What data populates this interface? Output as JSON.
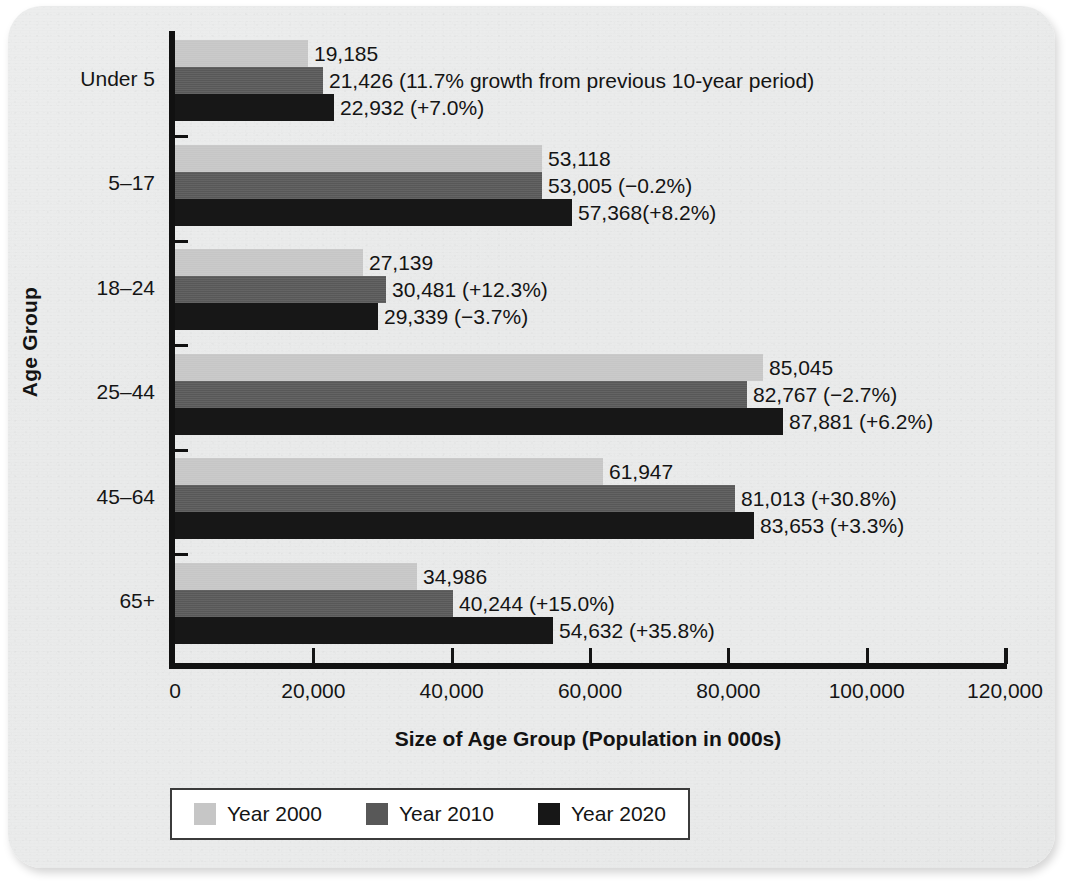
{
  "chart_data": {
    "type": "bar",
    "orientation": "horizontal",
    "title": "",
    "xlabel": "Size of Age Group (Population in 000s)",
    "ylabel": "Age Group",
    "xlim": [
      0,
      120000
    ],
    "xticks": [
      0,
      20000,
      40000,
      60000,
      80000,
      100000,
      120000
    ],
    "xtick_labels": [
      "0",
      "20,000",
      "40,000",
      "60,000",
      "80,000",
      "100,000",
      "120,000"
    ],
    "grid": false,
    "legend_position": "bottom",
    "categories": [
      "Under 5",
      "5–17",
      "18–24",
      "25–44",
      "45–64",
      "65+"
    ],
    "series": [
      {
        "name": "Year 2000",
        "color": "#c6c6c6",
        "values": [
          19185,
          53118,
          27139,
          85045,
          61947,
          34986
        ],
        "labels": [
          "19,185",
          "53,118",
          "27,139",
          "85,045",
          "61,947",
          "34,986"
        ]
      },
      {
        "name": "Year 2010",
        "color": "#585858",
        "values": [
          21426,
          53005,
          30481,
          82767,
          81013,
          40244
        ],
        "labels": [
          "21,426 (11.7% growth from previous 10-year period)",
          "53,005 (−0.2%)",
          "30,481 (+12.3%)",
          "82,767 (−2.7%)",
          "81,013 (+30.8%)",
          "40,244 (+15.0%)"
        ]
      },
      {
        "name": "Year 2020",
        "color": "#171717",
        "values": [
          22932,
          57368,
          29339,
          87881,
          83653,
          54632
        ],
        "labels": [
          "22,932 (+7.0%)",
          "57,368(+8.2%)",
          "29,339 (−3.7%)",
          "87,881 (+6.2%)",
          "83,653 (+3.3%)",
          "54,632 (+35.8%)"
        ]
      }
    ]
  },
  "legend": {
    "items": [
      {
        "label": "Year 2000",
        "color": "#c6c6c6"
      },
      {
        "label": "Year 2010",
        "color": "#585858"
      },
      {
        "label": "Year 2020",
        "color": "#171717"
      }
    ]
  }
}
